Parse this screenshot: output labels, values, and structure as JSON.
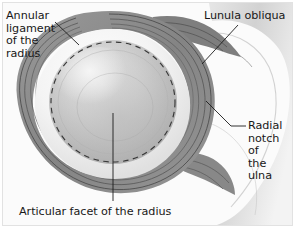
{
  "figure": {
    "kind": "anatomical-illustration",
    "view": "superior view of the annular ligament with the radial head removed",
    "background_color": "#fbfbfb",
    "border_color": "#e2e2e2",
    "text_color": "#181818"
  },
  "labels": {
    "annular_ligament": "Annular\nligament\nof the\nradius",
    "lunula_obliqua": "Lunula obliqua",
    "radial_notch": "Radial\nnotch of\nthe ulna",
    "articular_facet": "Articular facet of the radius"
  },
  "leaders": {
    "annular_ligament": "diagonal line from label down-right to the ligament band",
    "lunula_obliqua": "diagonal line from label down-left to the upper fiber fan",
    "radial_notch": "short horizontal dash then diagonal up-left to the ulnar notch",
    "articular_facet": "vertical line from label up to the center of the facet"
  },
  "structures": [
    {
      "name": "annular-ligament-band",
      "description": "thick gray ring encircling the radial head with fine striations",
      "fill": "#8d8d8d",
      "striation_color": "#4f4f4f"
    },
    {
      "name": "articular-facet",
      "description": "concave dished articular surface of the radial head",
      "fill_light": "#f2f2f2",
      "fill_mid": "#c8c8c8",
      "fill_shadow": "#9e9e9e"
    },
    {
      "name": "dashed-outline",
      "description": "dashed circle marking the hidden rim of the radial head",
      "color": "#2b2b2b"
    },
    {
      "name": "ulna-body",
      "description": "pale gray bone mass on the right bearing the radial notch",
      "fill_light": "#f4f4f4",
      "fill_mid": "#cfcfcf"
    },
    {
      "name": "upper-fiber-fan",
      "description": "ligament fibers fanning posteriorly to the ulna",
      "fill": "#7f7f7f"
    },
    {
      "name": "lower-fiber-fan",
      "description": "ligament fibers fanning anteriorly to the ulna",
      "fill": "#878787"
    }
  ]
}
